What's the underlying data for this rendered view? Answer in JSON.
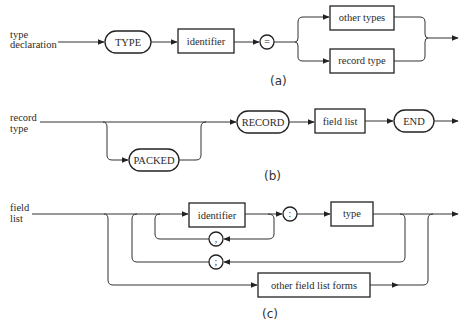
{
  "diagram_a": {
    "label_line1": "type",
    "label_line2": "declaration",
    "keyword_type": "TYPE",
    "box_identifier": "identifier",
    "symbol_equals": "=",
    "box_other_types": "other types",
    "box_record_type": "record type",
    "caption": "(a)"
  },
  "diagram_b": {
    "label_line1": "record",
    "label_line2": "type",
    "keyword_packed": "PACKED",
    "keyword_record": "RECORD",
    "box_field_list": "field list",
    "keyword_end": "END",
    "caption": "(b)"
  },
  "diagram_c": {
    "label_line1": "field",
    "label_line2": "list",
    "box_identifier": "identifier",
    "symbol_colon": ":",
    "box_type": "type",
    "symbol_comma": ",",
    "symbol_semicolon": ";",
    "box_other_forms": "other field list forms",
    "caption": "(c)"
  }
}
